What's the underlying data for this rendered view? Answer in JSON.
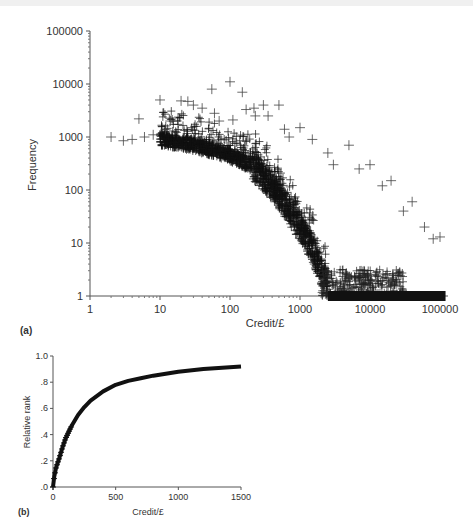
{
  "chart_data": [
    {
      "panel": "(a)",
      "type": "scatter",
      "xlabel": "Credit/£",
      "ylabel": "Frequency",
      "xscale": "log",
      "yscale": "log",
      "xlim": [
        1,
        100000
      ],
      "ylim": [
        1,
        100000
      ],
      "xticks": [
        "1",
        "10",
        "100",
        "1000",
        "10000",
        "100000"
      ],
      "yticks": [
        "1",
        "10",
        "100",
        "1000",
        "10000",
        "100000"
      ],
      "marker": "+",
      "grid": false,
      "description": "Dense main band: frequency ~1000 at credit 2-20, declining to ~300 at 200, ~30 at 1000, reaching 1 around 2500; solid band at frequency 1 from ~2500 to ~120000; sparse outliers above the band up to ~11000 at credit 100",
      "outliers": [
        {
          "x": 2,
          "y": 1000
        },
        {
          "x": 3,
          "y": 850
        },
        {
          "x": 4,
          "y": 900
        },
        {
          "x": 5,
          "y": 2200
        },
        {
          "x": 6,
          "y": 1000
        },
        {
          "x": 8,
          "y": 1100
        },
        {
          "x": 10,
          "y": 5000
        },
        {
          "x": 12,
          "y": 1400
        },
        {
          "x": 14,
          "y": 2000
        },
        {
          "x": 20,
          "y": 4800
        },
        {
          "x": 25,
          "y": 4700
        },
        {
          "x": 30,
          "y": 4000
        },
        {
          "x": 40,
          "y": 3500
        },
        {
          "x": 55,
          "y": 8000
        },
        {
          "x": 60,
          "y": 2800
        },
        {
          "x": 70,
          "y": 2000
        },
        {
          "x": 100,
          "y": 11000
        },
        {
          "x": 110,
          "y": 2100
        },
        {
          "x": 150,
          "y": 7000
        },
        {
          "x": 170,
          "y": 3300
        },
        {
          "x": 220,
          "y": 3500
        },
        {
          "x": 230,
          "y": 2500
        },
        {
          "x": 300,
          "y": 4000
        },
        {
          "x": 350,
          "y": 2500
        },
        {
          "x": 500,
          "y": 4000
        },
        {
          "x": 600,
          "y": 1400
        },
        {
          "x": 700,
          "y": 1000
        },
        {
          "x": 1000,
          "y": 1500
        },
        {
          "x": 1500,
          "y": 900
        },
        {
          "x": 2500,
          "y": 500
        },
        {
          "x": 3000,
          "y": 300
        },
        {
          "x": 5000,
          "y": 700
        },
        {
          "x": 7000,
          "y": 250
        },
        {
          "x": 10000,
          "y": 300
        },
        {
          "x": 15000,
          "y": 120
        },
        {
          "x": 20000,
          "y": 150
        },
        {
          "x": 30000,
          "y": 40
        },
        {
          "x": 40000,
          "y": 60
        },
        {
          "x": 60000,
          "y": 20
        },
        {
          "x": 80000,
          "y": 12
        },
        {
          "x": 100000,
          "y": 13
        }
      ],
      "main_band": [
        {
          "x": 2,
          "y": 950
        },
        {
          "x": 10,
          "y": 900
        },
        {
          "x": 20,
          "y": 800
        },
        {
          "x": 50,
          "y": 600
        },
        {
          "x": 100,
          "y": 450
        },
        {
          "x": 200,
          "y": 300
        },
        {
          "x": 300,
          "y": 180
        },
        {
          "x": 500,
          "y": 80
        },
        {
          "x": 700,
          "y": 40
        },
        {
          "x": 1000,
          "y": 20
        },
        {
          "x": 1500,
          "y": 8
        },
        {
          "x": 2000,
          "y": 3
        },
        {
          "x": 2500,
          "y": 1.5
        }
      ],
      "floor_band": {
        "y": 1,
        "x_from": 2500,
        "x_to": 120000
      }
    },
    {
      "panel": "(b)",
      "type": "line",
      "xlabel": "Credit/£",
      "ylabel": "Relative rank",
      "xlim": [
        0,
        1500
      ],
      "ylim": [
        0,
        1.0
      ],
      "xticks": [
        "0",
        "500",
        "1000",
        "1500"
      ],
      "yticks": [
        ".0",
        ".2",
        ".4",
        ".6",
        ".8",
        "1.0"
      ],
      "marker": "+",
      "grid": false,
      "x": [
        0,
        10,
        25,
        50,
        75,
        100,
        150,
        200,
        250,
        300,
        400,
        500,
        600,
        700,
        800,
        900,
        1000,
        1200,
        1500
      ],
      "y": [
        0.0,
        0.08,
        0.15,
        0.22,
        0.3,
        0.37,
        0.47,
        0.55,
        0.61,
        0.66,
        0.73,
        0.78,
        0.81,
        0.83,
        0.85,
        0.865,
        0.88,
        0.9,
        0.92
      ]
    }
  ],
  "panel_a": {
    "ylabel": "Frequency",
    "xlabel": "Credit/£",
    "tag": "(a)",
    "yticks": [
      "100000",
      "10000",
      "1000",
      "100",
      "10",
      "1"
    ],
    "xticks": [
      "1",
      "10",
      "100",
      "1000",
      "10000",
      "100000"
    ]
  },
  "panel_b": {
    "ylabel": "Relative rank",
    "xlabel": "Credit/£",
    "tag": "(b)",
    "yticks": [
      "1.0",
      ".8",
      ".6",
      ".4",
      ".2",
      ".0"
    ],
    "xticks": [
      "0",
      "500",
      "1000",
      "1500"
    ]
  }
}
